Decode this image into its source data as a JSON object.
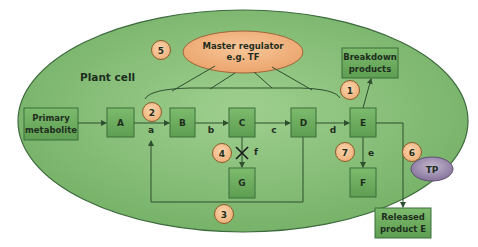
{
  "diagram": {
    "container_label": "Plant cell",
    "regulator": {
      "line1": "Master regulator",
      "line2": "e.g. TF"
    },
    "nodes": {
      "primary": {
        "line1": "Primary",
        "line2": "metabolite"
      },
      "A": "A",
      "B": "B",
      "C": "C",
      "D": "D",
      "E": "E",
      "F": "F",
      "G": "G",
      "breakdown": {
        "line1": "Breakdown",
        "line2": "products"
      },
      "released": {
        "line1": "Released",
        "line2": "product E"
      }
    },
    "edge_labels": {
      "a": "a",
      "b": "b",
      "c": "c",
      "d": "d",
      "e": "e",
      "f": "f"
    },
    "blocked_symbol": "✕",
    "transporter": "TP",
    "markers": [
      "1",
      "2",
      "3",
      "4",
      "5",
      "6",
      "7"
    ],
    "colors": {
      "cell": "#86bf78",
      "cell_border": "#3d6a3d",
      "box": "#6fae60",
      "regulator": "#f2b27e",
      "marker": "#f3c08e",
      "transporter": "#9a8aa8"
    }
  }
}
